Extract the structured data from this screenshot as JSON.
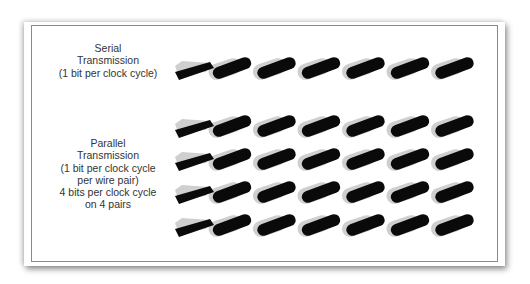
{
  "diagram": {
    "serial": {
      "lines": [
        "Serial",
        "Transmission",
        "(1 bit per clock cycle)"
      ],
      "pairs": 1
    },
    "parallel": {
      "lines": [
        "Parallel",
        "Transmission",
        "(1 bit per clock cycle",
        "per wire pair)",
        "4 bits per clock cycle",
        "on 4 pairs"
      ],
      "pairs": 4
    },
    "cable": {
      "segments_per_cable": 6,
      "wire_colors": {
        "dark": "#0a0a0a",
        "light": "#cfcfcf"
      },
      "start_x": 175,
      "segment_pitch": 44.5
    },
    "rows_y": {
      "serial": [
        70
      ],
      "parallel": [
        128,
        161,
        194,
        227
      ]
    }
  }
}
